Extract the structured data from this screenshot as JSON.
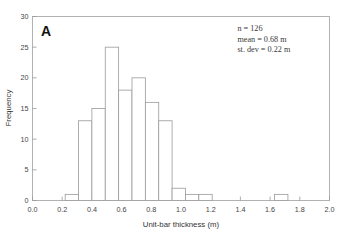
{
  "chart_data": {
    "type": "bar",
    "title": "",
    "subtitle": "",
    "panel_label": "A",
    "xlabel": "Unit-bar thickness (m)",
    "ylabel": "Frequency",
    "xlim": [
      0.0,
      2.0
    ],
    "ylim": [
      0,
      30
    ],
    "grid": false,
    "legend": null,
    "xticks": [
      0.0,
      0.2,
      0.4,
      0.6,
      0.8,
      1.0,
      1.2,
      1.4,
      1.6,
      1.8,
      2.0
    ],
    "xtick_labels": [
      "0.0",
      "0.2",
      "0.4",
      "0.6",
      "0.8",
      "1.0",
      "1.2",
      "1.4",
      "1.6",
      "1.8",
      "2.0"
    ],
    "yticks": [
      0,
      5,
      10,
      15,
      20,
      25,
      30
    ],
    "ytick_labels": [
      "0",
      "5",
      "10",
      "15",
      "20",
      "25",
      "30"
    ],
    "bin_edges": [
      0.22,
      0.31,
      0.4,
      0.49,
      0.58,
      0.67,
      0.76,
      0.85,
      0.94,
      1.03,
      1.12,
      1.21,
      1.3
    ],
    "bin_centers": [
      0.265,
      0.355,
      0.445,
      0.535,
      0.625,
      0.715,
      0.805,
      0.895,
      0.985,
      1.075,
      1.165,
      1.255
    ],
    "values": [
      1,
      13,
      15,
      25,
      18,
      20,
      16,
      13,
      2,
      1,
      1,
      0
    ],
    "outlier_bars": [
      {
        "left": 1.63,
        "right": 1.72,
        "value": 1
      }
    ],
    "annotations": [
      {
        "text": "n = 126",
        "x": 1.38,
        "y": 27.6
      },
      {
        "text": "mean = 0.68 m",
        "x": 1.38,
        "y": 25.9
      },
      {
        "text": "st. dev = 0.22 m",
        "x": 1.38,
        "y": 24.2
      }
    ],
    "stats": {
      "n": 126,
      "mean": 0.68,
      "st_dev": 0.22,
      "units": "m"
    },
    "colors": {
      "bar_fill": "#ffffff",
      "bar_stroke": "#9a9a9a",
      "frame": "#aaaaaa",
      "text": "#333333",
      "background": "#ffffff"
    }
  }
}
